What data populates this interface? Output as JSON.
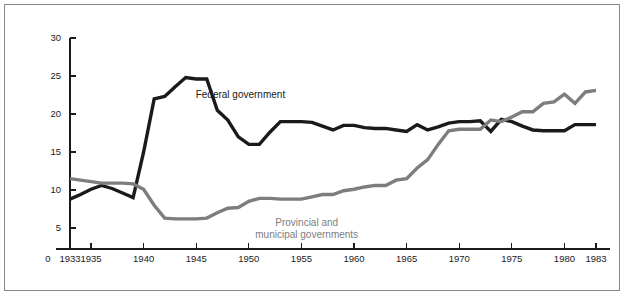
{
  "chart_data": {
    "type": "line",
    "title": "",
    "subtitle": "",
    "xlabel": "",
    "ylabel": "Taxes as a\nPercentage of GNP",
    "ylabel_line1": "Taxes as a",
    "ylabel_line2": "Percentage of GNP",
    "xlim": [
      1933,
      1983
    ],
    "ylim": [
      0,
      30
    ],
    "grid": false,
    "legend_position": "inline-annotations",
    "y_ticks": [
      5,
      10,
      15,
      20,
      25,
      30
    ],
    "y_tick_labels": [
      "5",
      "10",
      "15",
      "20",
      "25",
      "30"
    ],
    "x_ticks": [
      1933,
      1935,
      1940,
      1945,
      1950,
      1955,
      1960,
      1965,
      1970,
      1975,
      1980,
      1983
    ],
    "x_tick_labels": [
      "1933",
      "1935",
      "1940",
      "1945",
      "1950",
      "1955",
      "1960",
      "1965",
      "1970",
      "1975",
      "1980",
      "1983"
    ],
    "origin_label": "0",
    "x": [
      1933,
      1934,
      1935,
      1936,
      1937,
      1938,
      1939,
      1940,
      1941,
      1942,
      1943,
      1944,
      1945,
      1946,
      1947,
      1948,
      1949,
      1950,
      1951,
      1952,
      1953,
      1954,
      1955,
      1956,
      1957,
      1958,
      1959,
      1960,
      1961,
      1962,
      1963,
      1964,
      1965,
      1966,
      1967,
      1968,
      1969,
      1970,
      1971,
      1972,
      1973,
      1974,
      1975,
      1976,
      1977,
      1978,
      1979,
      1980,
      1981,
      1982,
      1983
    ],
    "series": [
      {
        "name": "Federal government",
        "color": "#1a1a1a",
        "label_x": 1949.2,
        "label_y": 22.1,
        "values": [
          8.8,
          9.4,
          10.1,
          10.6,
          10.2,
          9.6,
          9.0,
          15.0,
          22.0,
          22.3,
          23.6,
          24.8,
          24.6,
          24.6,
          20.5,
          19.2,
          17.0,
          16.0,
          16.0,
          17.6,
          19.0,
          19.0,
          19.0,
          18.9,
          18.4,
          17.9,
          18.5,
          18.5,
          18.2,
          18.1,
          18.1,
          17.9,
          17.7,
          18.6,
          17.9,
          18.3,
          18.8,
          19.0,
          19.0,
          19.1,
          17.7,
          19.3,
          19.0,
          18.4,
          17.9,
          17.8,
          17.8,
          17.8,
          18.6,
          18.6,
          18.6
        ]
      },
      {
        "name": "Provincial and municipal governments",
        "color": "#7d7d7d",
        "label_line1": "Provincial and",
        "label_line2": "municipal governments",
        "label_x": 1955.5,
        "label_y": 5.2,
        "values": [
          11.5,
          11.3,
          11.1,
          10.9,
          10.9,
          10.9,
          10.8,
          10.1,
          8.0,
          6.3,
          6.2,
          6.2,
          6.2,
          6.3,
          7.0,
          7.6,
          7.7,
          8.5,
          8.9,
          8.9,
          8.8,
          8.8,
          8.8,
          9.1,
          9.4,
          9.4,
          9.9,
          10.1,
          10.4,
          10.6,
          10.6,
          11.3,
          11.5,
          12.9,
          14.0,
          16.0,
          17.8,
          18.0,
          18.0,
          18.0,
          19.2,
          19.0,
          19.6,
          20.3,
          20.3,
          21.4,
          21.6,
          22.6,
          21.4,
          22.9,
          23.1
        ]
      }
    ]
  }
}
